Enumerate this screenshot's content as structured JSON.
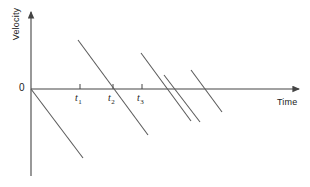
{
  "figure": {
    "kind": "velocity-time-graph",
    "background": "#ffffff",
    "line_color": "#555555",
    "axis_color": "#444444",
    "text_color": "#222222"
  },
  "axes": {
    "y_label": "Velocity",
    "x_label": "Time",
    "origin_label": "0",
    "origin": {
      "x": 31,
      "y": 89
    },
    "x_axis": {
      "x1": 31,
      "y1": 89,
      "x2": 302,
      "y2": 89
    },
    "y_axis": {
      "x1": 31,
      "y1": 10,
      "x2": 31,
      "y2": 176
    }
  },
  "ticks": [
    {
      "id": "t1",
      "symbol": "t",
      "subscript": "1",
      "x": 80,
      "label_x": 75,
      "label_y": 92
    },
    {
      "id": "t2",
      "symbol": "t",
      "subscript": "2",
      "x": 113,
      "label_x": 108,
      "label_y": 92
    },
    {
      "id": "t3",
      "symbol": "t",
      "subscript": "3",
      "x": 142,
      "label_x": 137,
      "label_y": 92
    }
  ],
  "chart_data": {
    "type": "line",
    "title": "",
    "xlabel": "Time",
    "ylabel": "Velocity",
    "grid": false,
    "legend": "none",
    "axis_ranges": {
      "x": [
        0,
        271
      ],
      "y": [
        -87,
        79
      ]
    },
    "tick_labels_x": [
      "t_1",
      "t_2",
      "t_3"
    ],
    "tick_values_x": [
      49,
      82,
      111
    ],
    "tick_labels_y": [
      "0"
    ],
    "segments": [
      {
        "name": "segment-1",
        "x1": 31,
        "y1": 89,
        "x2": 83,
        "y2": 158
      },
      {
        "name": "segment-2",
        "x1": 78,
        "y1": 40,
        "x2": 148,
        "y2": 135
      },
      {
        "name": "segment-3",
        "x1": 141,
        "y1": 53,
        "x2": 191,
        "y2": 121
      },
      {
        "name": "segment-4",
        "x1": 164,
        "y1": 75,
        "x2": 200,
        "y2": 122
      },
      {
        "name": "segment-5",
        "x1": 191,
        "y1": 70,
        "x2": 222,
        "y2": 112
      }
    ]
  }
}
